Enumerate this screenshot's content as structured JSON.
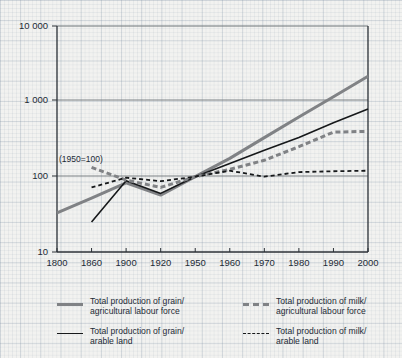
{
  "chart_data": {
    "type": "line",
    "title": "",
    "subtitle": "",
    "annotation": "(1950=100)",
    "xlabel": "",
    "ylabel": "",
    "x_tick_labels": [
      "1800",
      "1860",
      "1900",
      "1920",
      "1950",
      "1960",
      "1970",
      "1980",
      "1990",
      "2000"
    ],
    "x_axis_note": "categorical evenly-spaced year ticks (non-linear time)",
    "y_tick_labels": [
      "10",
      "100",
      "1 000",
      "10 000"
    ],
    "y_tick_values": [
      10,
      100,
      1000,
      10000
    ],
    "y_scale": "log",
    "ylim": [
      10,
      10000
    ],
    "grid": "background graph-paper grid; horizontal gridlines at decades",
    "legend_position": "below-plot, two columns",
    "categories": [
      "1800",
      "1860",
      "1900",
      "1920",
      "1950",
      "1960",
      "1970",
      "1980",
      "1990",
      "2000"
    ],
    "series": [
      {
        "name": "Total production of grain/agricultural labour force",
        "style": "solid",
        "color": "#808285",
        "width": 3,
        "values": [
          33,
          52,
          83,
          57,
          100,
          175,
          330,
          620,
          1150,
          2150
        ]
      },
      {
        "name": "Total production of grain/arable land",
        "style": "solid",
        "color": "#16181a",
        "width": 1.6,
        "values": [
          null,
          25,
          88,
          60,
          100,
          150,
          225,
          330,
          520,
          790
        ]
      },
      {
        "name": "Total production of milk/agricultural labour force",
        "style": "dashed",
        "color": "#808285",
        "width": 3,
        "values": [
          null,
          133,
          90,
          72,
          100,
          125,
          165,
          250,
          390,
          400
        ]
      },
      {
        "name": "Total production of milk/arable land",
        "style": "dashed",
        "color": "#16181a",
        "width": 1.8,
        "values": [
          null,
          72,
          97,
          87,
          100,
          120,
          100,
          115,
          118,
          120
        ]
      }
    ]
  },
  "axes": {
    "y_labels": [
      "10 000",
      "1 000",
      "100",
      "10"
    ],
    "x_labels": [
      "1800",
      "1860",
      "1900",
      "1920",
      "1950",
      "1960",
      "1970",
      "1980",
      "1990",
      "2000"
    ],
    "annotation": "(1950=100)"
  },
  "legend": {
    "items": [
      {
        "label": "Total production of grain/\nagricultural labour force",
        "swatch": "grain-alf"
      },
      {
        "label": "Total production of grain/\narable land",
        "swatch": "grain-land"
      },
      {
        "label": "Total production of milk/\nagricultural labour force",
        "swatch": "milk-alf"
      },
      {
        "label": "Total production of milk/\narable land",
        "swatch": "milk-land"
      }
    ]
  },
  "colors": {
    "series_gray": "#808285",
    "series_black": "#16181a",
    "axis": "#2b3137",
    "background": "#f2f2f0"
  }
}
